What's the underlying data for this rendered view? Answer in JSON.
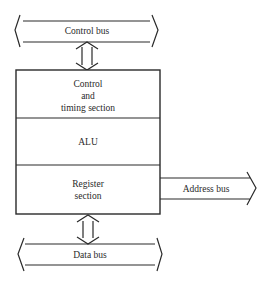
{
  "diagram": {
    "control_bus": {
      "label": "Control bus"
    },
    "cpu_block": {
      "control_section": {
        "line1": "Control",
        "line2": "and",
        "line3": "timing section"
      },
      "alu_section": {
        "label": "ALU"
      },
      "register_section": {
        "line1": "Register",
        "line2": "section"
      }
    },
    "address_bus": {
      "label": "Address bus"
    },
    "data_bus": {
      "label": "Data bus"
    },
    "colors": {
      "line": "#2a2a2a",
      "background": "#ffffff"
    }
  }
}
